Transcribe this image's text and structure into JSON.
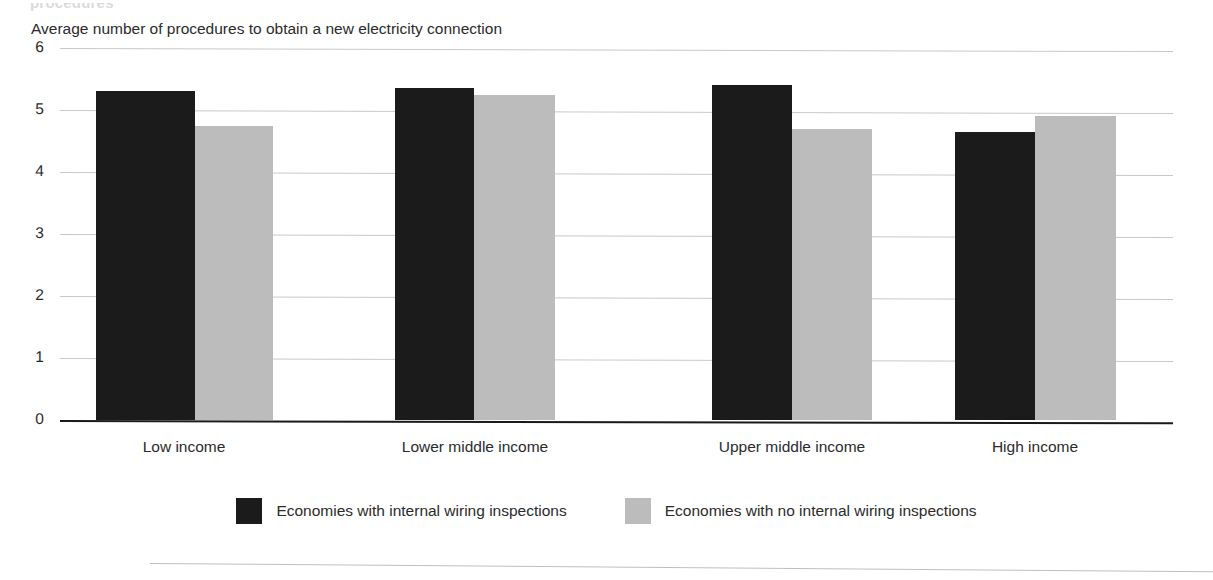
{
  "figure": {
    "cropped_heading": "procedures",
    "subtitle": "Average number of procedures to obtain a new electricity connection"
  },
  "legend": {
    "items": [
      {
        "label": "Economies with internal wiring inspections",
        "color": "#1b1b1b",
        "swatch": "dark-swatch"
      },
      {
        "label": "Economies with no internal wiring inspections",
        "color": "#bcbcbc",
        "swatch": "light-swatch"
      }
    ]
  },
  "chart_data": {
    "type": "bar",
    "title": "",
    "subtitle": "Average number of procedures to obtain a new electricity connection",
    "xlabel": "",
    "ylabel": "",
    "ylim": [
      0,
      6
    ],
    "yticks": [
      0,
      1,
      2,
      3,
      4,
      5,
      6
    ],
    "ytick_labels": [
      "0",
      "1",
      "2",
      "3",
      "4",
      "5",
      "6"
    ],
    "grid": true,
    "legend_position": "bottom",
    "categories": [
      "Low income",
      "Lower middle income",
      "Upper middle income",
      "High income"
    ],
    "series": [
      {
        "name": "Economies with internal wiring inspections",
        "color": "#1b1b1b",
        "values": [
          5.3,
          5.35,
          5.4,
          4.65
        ]
      },
      {
        "name": "Economies with no internal wiring inspections",
        "color": "#bcbcbc",
        "values": [
          4.75,
          5.25,
          4.7,
          4.9
        ]
      }
    ]
  }
}
